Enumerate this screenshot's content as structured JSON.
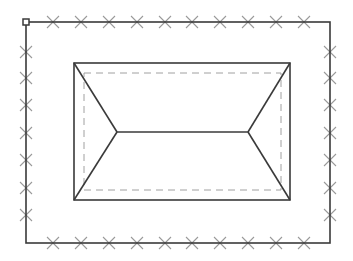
{
  "canvas": {
    "width": 353,
    "height": 261,
    "background": "#ffffff"
  },
  "colors": {
    "outline": "#3a3a3a",
    "marker": "#9a9a9a",
    "dashed": "#a0a0a0"
  },
  "plot_boundary": {
    "x1": 26,
    "y1": 22,
    "x2": 330,
    "y2": 243,
    "handle": {
      "x": 23,
      "y": 19,
      "size": 6
    },
    "markers_top_x": [
      53,
      81,
      109,
      137,
      165,
      192,
      220,
      248,
      276,
      304
    ],
    "markers_bottom_x": [
      53,
      81,
      109,
      137,
      165,
      192,
      220,
      248,
      276,
      304
    ],
    "markers_side_y": [
      52,
      78,
      105,
      133,
      160,
      188,
      215
    ]
  },
  "roof": {
    "outer": {
      "x1": 74,
      "y1": 63,
      "x2": 290,
      "y2": 200
    },
    "overhang_dashed": {
      "x1": 84,
      "y1": 73,
      "x2": 281,
      "y2": 190
    },
    "ridge": {
      "x1": 117,
      "x2": 248,
      "y": 132
    }
  }
}
